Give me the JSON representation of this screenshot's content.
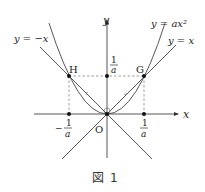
{
  "figure": {
    "caption_kanji": "図",
    "caption_number": "1"
  },
  "axes": {
    "x_label": "x",
    "y_label": "y",
    "origin_label": "O"
  },
  "curves": {
    "parabola_label": "y = ax²",
    "line_pos_label": "y = x",
    "line_neg_label": "y = −x"
  },
  "points": {
    "G_label": "G",
    "H_label": "H"
  },
  "ticks": {
    "x_pos_num": "1",
    "x_pos_den": "a",
    "x_neg_sign": "−",
    "x_neg_num": "1",
    "x_neg_den": "a",
    "y_num": "1",
    "y_den": "a"
  },
  "colors": {
    "stroke": "#333333",
    "dash": "#666666",
    "text": "#222222"
  }
}
